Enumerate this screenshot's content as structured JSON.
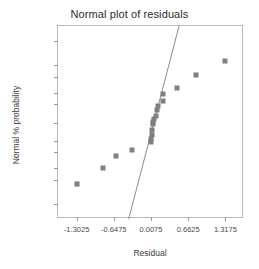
{
  "chart_data": {
    "type": "scatter",
    "title": "Normal plot of residuals",
    "xlabel": "Residual",
    "ylabel": "Normal % probability",
    "grid": false,
    "legend": null,
    "xlim": [
      -1.63,
      1.645
    ],
    "xticks": [
      -1.3025,
      -0.6475,
      0.0075,
      0.6625,
      1.3175
    ],
    "xtick_labels": [
      "-1.3025",
      "-0.6475",
      "0.0075",
      "0.6625",
      "1.3175"
    ],
    "yscale": "probit",
    "yticks": [
      1,
      5,
      10,
      20,
      30,
      50,
      70,
      80,
      90,
      95,
      99
    ],
    "ytick_labels": [
      "1",
      "5",
      "10",
      "20",
      "30",
      "50",
      "70",
      "80",
      "90",
      "95",
      "99"
    ],
    "marker": "filled-square",
    "marker_color": "#7f7f7f",
    "line_color": "#8c8c8c",
    "points": [
      {
        "x": -1.3,
        "y": 4
      },
      {
        "x": -0.84,
        "y": 10
      },
      {
        "x": -0.61,
        "y": 17
      },
      {
        "x": -0.33,
        "y": 22
      },
      {
        "x": 0.0,
        "y": 29
      },
      {
        "x": 0.01,
        "y": 32
      },
      {
        "x": 0.02,
        "y": 36
      },
      {
        "x": 0.03,
        "y": 42
      },
      {
        "x": 0.04,
        "y": 48
      },
      {
        "x": 0.05,
        "y": 51
      },
      {
        "x": 0.06,
        "y": 54
      },
      {
        "x": 0.09,
        "y": 57
      },
      {
        "x": 0.12,
        "y": 64
      },
      {
        "x": 0.13,
        "y": 68
      },
      {
        "x": 0.21,
        "y": 73
      },
      {
        "x": 0.22,
        "y": 79
      },
      {
        "x": 0.46,
        "y": 84
      },
      {
        "x": 0.8,
        "y": 91
      },
      {
        "x": 1.31,
        "y": 96
      }
    ],
    "reference_line": {
      "x_start": 0.589,
      "y_start": 99.97,
      "x_end": -0.395,
      "y_end": 0.25
    }
  }
}
